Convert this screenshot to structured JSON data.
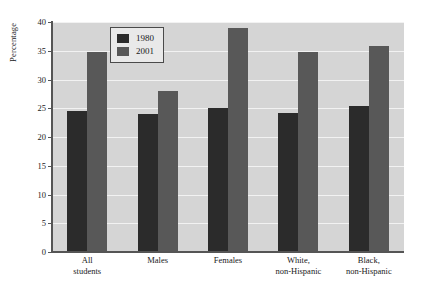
{
  "chart_data": {
    "type": "bar",
    "title": "",
    "xlabel": "",
    "ylabel": "Percentage",
    "ylim": [
      0,
      40
    ],
    "ytick_step": 5,
    "yticks": [
      0,
      5,
      10,
      15,
      20,
      25,
      30,
      35,
      40
    ],
    "ytick_labels": [
      "0",
      "5",
      "10",
      "15",
      "20",
      "25",
      "30",
      "35",
      "40"
    ],
    "grid": true,
    "grid_color": "#f2f2f2",
    "plot_background": "#d5d5d5",
    "legend_position": "upper-center-left",
    "categories": [
      "All\nstudents",
      "Males",
      "Females",
      "White,\nnon-Hispanic",
      "Black,\nnon-Hispanic"
    ],
    "series": [
      {
        "name": "1980",
        "color": "#2b2b2b",
        "values": [
          24.6,
          24.0,
          25.1,
          24.2,
          25.4
        ]
      },
      {
        "name": "2001",
        "color": "#585858",
        "values": [
          34.7,
          28.0,
          39.0,
          34.7,
          35.8
        ]
      }
    ]
  }
}
